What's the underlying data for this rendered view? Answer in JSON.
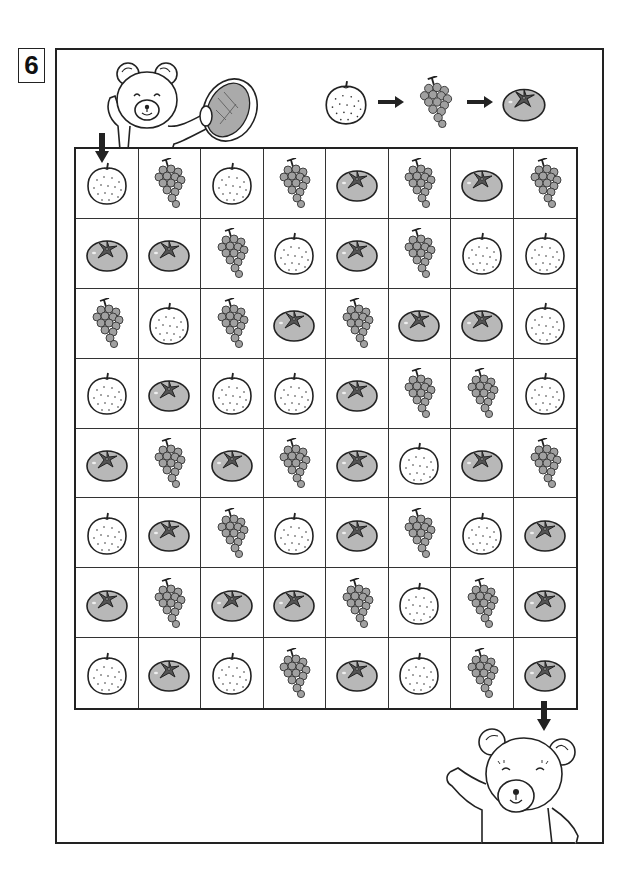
{
  "puzzle": {
    "number": "6",
    "title_icon": "numbered-box"
  },
  "sequence_legend": {
    "order": [
      "pear",
      "grape",
      "persimmon"
    ],
    "arrow_icon": "right-arrow-icon"
  },
  "illustrations": {
    "top_left": "bear-with-melon",
    "bottom_right": "bear-waving"
  },
  "start": {
    "row": 1,
    "col": 1,
    "icon": "down-arrow-icon"
  },
  "goal": {
    "row": 8,
    "col": 8,
    "icon": "down-arrow-icon"
  },
  "grid": {
    "rows": 8,
    "cols": 8,
    "cells": [
      [
        "pear",
        "grape",
        "pear",
        "grape",
        "persimmon",
        "grape",
        "persimmon",
        "grape"
      ],
      [
        "persimmon",
        "persimmon",
        "grape",
        "pear",
        "persimmon",
        "grape",
        "pear",
        "pear"
      ],
      [
        "grape",
        "pear",
        "grape",
        "persimmon",
        "grape",
        "persimmon",
        "persimmon",
        "pear"
      ],
      [
        "pear",
        "persimmon",
        "pear",
        "pear",
        "persimmon",
        "grape",
        "grape",
        "pear"
      ],
      [
        "persimmon",
        "grape",
        "persimmon",
        "grape",
        "persimmon",
        "pear",
        "persimmon",
        "grape"
      ],
      [
        "pear",
        "persimmon",
        "grape",
        "pear",
        "persimmon",
        "grape",
        "pear",
        "persimmon"
      ],
      [
        "persimmon",
        "grape",
        "persimmon",
        "persimmon",
        "grape",
        "pear",
        "grape",
        "persimmon"
      ],
      [
        "pear",
        "persimmon",
        "pear",
        "grape",
        "persimmon",
        "pear",
        "grape",
        "persimmon"
      ]
    ]
  },
  "colors": {
    "line": "#222222",
    "persimmon_body": "#b8b8b8",
    "persimmon_leaf": "#555555",
    "grape": "#a0a0a0",
    "pear_body": "#ffffff"
  }
}
